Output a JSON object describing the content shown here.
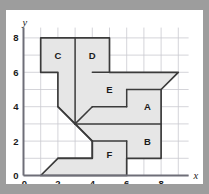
{
  "figure": {
    "type": "coordinate-grid-dissection",
    "background_color": "#9d9d9d",
    "card_color": "#ffffff",
    "shape_fill": "#e6e6e6",
    "shape_stroke": "#3b3b3b",
    "grid_color": "#c9c9cf",
    "axis_color": "#6e6e78",
    "axes": {
      "x_label": "x",
      "y_label": "y",
      "x_ticks": [
        "0",
        "2",
        "4",
        "6",
        "8"
      ],
      "y_ticks": [
        "0",
        "2",
        "4",
        "6",
        "8"
      ],
      "x_tick_values": [
        0,
        2,
        4,
        6,
        8
      ],
      "y_tick_values": [
        0,
        2,
        4,
        6,
        8
      ],
      "x_range": [
        0,
        9.6
      ],
      "y_range": [
        0,
        8.6
      ],
      "grid_step": 1,
      "origin_label": "0"
    },
    "regions": [
      {
        "id": "C",
        "label": "C",
        "label_pos": [
          2.0,
          7.0
        ],
        "points": "1,8 3,8 3,3 2,4 2,6 1,6"
      },
      {
        "id": "D",
        "label": "D",
        "label_pos": [
          4.0,
          7.0
        ],
        "points": "3,8 5,8 5,6 4,6 4,4 3,3"
      },
      {
        "id": "E",
        "label": "E",
        "label_pos": [
          5.0,
          5.0
        ],
        "points": "4,6 9,6 8,5 6,5 6,4 4,4"
      },
      {
        "id": "A",
        "label": "A",
        "label_pos": [
          7.2,
          4.0
        ],
        "points": "6,5 8,5 9,6 8,6 8,3 3,3 4,4 6,4"
      },
      {
        "id": "B",
        "label": "B",
        "label_pos": [
          7.2,
          2.0
        ],
        "points": "3,3 8,3 8,1 6,1 6,2 4,2"
      },
      {
        "id": "F",
        "label": "F",
        "label_pos": [
          5.0,
          1.2
        ],
        "points": "4,2 6,2 6,0 1,0 2,1 4,1"
      }
    ],
    "outline": "1,8 5,8 5,6 9,6 8,5 8,3 8,1 6,1 6,0 1,0 2,1 4,1 4,2 3,3 2,4 2,6 1,6",
    "internal_edges": [
      {
        "name": "edge-c-d-vertical",
        "from": [
          3,
          8
        ],
        "to": [
          3,
          3
        ]
      },
      {
        "name": "edge-c-diagonal",
        "from": [
          3,
          3
        ],
        "to": [
          2,
          4
        ]
      },
      {
        "name": "edge-d-diagonal",
        "from": [
          3,
          3
        ],
        "to": [
          4,
          4
        ]
      },
      {
        "name": "edge-b-diagonal",
        "from": [
          3,
          3
        ],
        "to": [
          4,
          2
        ]
      },
      {
        "name": "edge-d-e-horizontal",
        "from": [
          4,
          6
        ],
        "to": [
          5,
          6
        ]
      },
      {
        "name": "edge-e-a-step-h",
        "from": [
          4,
          4
        ],
        "to": [
          6,
          4
        ]
      },
      {
        "name": "edge-e-a-step-v",
        "from": [
          6,
          4
        ],
        "to": [
          6,
          5
        ]
      },
      {
        "name": "edge-e-a-step-h2",
        "from": [
          6,
          5
        ],
        "to": [
          8,
          5
        ]
      },
      {
        "name": "edge-a-b-horizontal",
        "from": [
          3,
          3
        ],
        "to": [
          8,
          3
        ]
      },
      {
        "name": "edge-b-f-step-v",
        "from": [
          6,
          2
        ],
        "to": [
          6,
          1
        ]
      },
      {
        "name": "edge-b-f-step-h",
        "from": [
          4,
          2
        ],
        "to": [
          6,
          2
        ]
      },
      {
        "name": "edge-f-top-h",
        "from": [
          2,
          1
        ],
        "to": [
          4,
          1
        ]
      },
      {
        "name": "edge-f-v",
        "from": [
          4,
          2
        ],
        "to": [
          4,
          1
        ]
      }
    ]
  }
}
